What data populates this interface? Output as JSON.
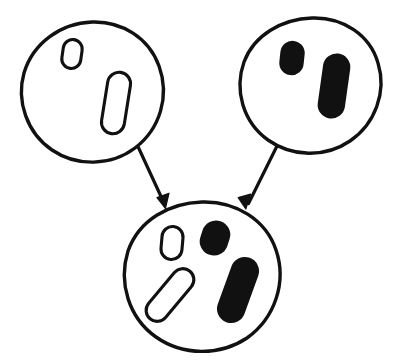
{
  "figure": {
    "kind": "hand-drawn-diagram",
    "title": "",
    "caption": "",
    "background_color": "#ffffff",
    "ink_color": "#111111",
    "canvas": {
      "width": 404,
      "height": 361
    }
  },
  "legend": {
    "open_shape_label": "outlined rounded rectangle",
    "filled_shape_label": "solid black rounded rectangle"
  },
  "nodes": [
    {
      "id": "parent-left",
      "role": "parent",
      "label": "",
      "cx": 92,
      "cy": 92,
      "r": 70,
      "fill": "#ffffff",
      "stroke": "#111111",
      "contents": [
        {
          "id": "parent-left-small-open",
          "style": "open",
          "shape": "rounded-rect",
          "cx": 72,
          "cy": 54,
          "w": 19,
          "h": 29,
          "rx": 9.5,
          "rotate": 8
        },
        {
          "id": "parent-left-long-open",
          "style": "open",
          "shape": "rounded-rect",
          "cx": 116,
          "cy": 103,
          "w": 23,
          "h": 62,
          "rx": 11.5,
          "rotate": 9
        }
      ]
    },
    {
      "id": "parent-right",
      "role": "parent",
      "label": "",
      "cx": 312,
      "cy": 86,
      "r": 68,
      "fill": "#ffffff",
      "stroke": "#111111",
      "contents": [
        {
          "id": "parent-right-small-filled",
          "style": "filled",
          "shape": "rounded-rect",
          "cx": 292,
          "cy": 58,
          "w": 22,
          "h": 32,
          "rx": 11,
          "rotate": 6
        },
        {
          "id": "parent-right-long-filled",
          "style": "filled",
          "shape": "rounded-rect",
          "cx": 334,
          "cy": 86,
          "w": 25,
          "h": 63,
          "rx": 12.5,
          "rotate": 8
        }
      ]
    },
    {
      "id": "child",
      "role": "child",
      "label": "",
      "cx": 202,
      "cy": 278,
      "r": 76,
      "fill": "#ffffff",
      "stroke": "#111111",
      "contents": [
        {
          "id": "child-small-open",
          "style": "open",
          "shape": "rounded-rect",
          "cx": 172,
          "cy": 243,
          "w": 21,
          "h": 33,
          "rx": 10.5,
          "rotate": 5
        },
        {
          "id": "child-small-filled",
          "style": "filled",
          "shape": "rounded-rect",
          "cx": 215,
          "cy": 238,
          "w": 26,
          "h": 33,
          "rx": 13,
          "rotate": 18
        },
        {
          "id": "child-long-open",
          "style": "open",
          "shape": "rounded-rect",
          "cx": 170,
          "cy": 295,
          "w": 22,
          "h": 62,
          "rx": 11,
          "rotate": 40
        },
        {
          "id": "child-long-filled",
          "style": "filled",
          "shape": "rounded-rect",
          "cx": 238,
          "cy": 290,
          "w": 26,
          "h": 66,
          "rx": 13,
          "rotate": 20
        }
      ]
    }
  ],
  "edges": [
    {
      "id": "edge-left",
      "from": "parent-left",
      "to": "child",
      "label": "",
      "x1": 139,
      "y1": 148,
      "x2": 165,
      "y2": 206,
      "arrowhead": "filled-triangle"
    },
    {
      "id": "edge-right",
      "from": "parent-right",
      "to": "child",
      "label": "",
      "x1": 277,
      "y1": 145,
      "x2": 246,
      "y2": 207,
      "arrowhead": "filled-triangle"
    }
  ]
}
